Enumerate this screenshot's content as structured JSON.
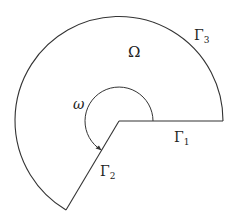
{
  "diagram": {
    "type": "domain-with-reentrant-corner",
    "stroke_color": "#333333",
    "center": [
      119,
      121
    ],
    "outer_radius": 104,
    "inner_arc_radius": 34,
    "labels": {
      "domain": "Ω",
      "angle": "ω",
      "gamma": "Γ",
      "gamma1_sub": "1",
      "gamma2_sub": "2",
      "gamma3_sub": "3"
    },
    "boundary_parts": [
      "Γ1 (straight edge, right)",
      "Γ2 (straight edge, lower-left)",
      "Γ3 (outer circular arc)"
    ]
  }
}
